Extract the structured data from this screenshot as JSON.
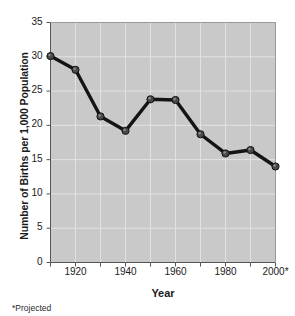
{
  "chart_data": {
    "type": "line",
    "title": "",
    "xlabel": "Year",
    "ylabel": "Number of Births per 1,000 Population",
    "footnote": "*Projected",
    "x": [
      1910,
      1920,
      1930,
      1940,
      1950,
      1960,
      1970,
      1980,
      1990,
      2000
    ],
    "values": [
      30.1,
      28.1,
      21.3,
      19.2,
      23.8,
      23.7,
      18.7,
      15.9,
      16.4,
      14.0
    ],
    "xlim": [
      1910,
      2000
    ],
    "ylim": [
      0,
      35
    ],
    "ytick_labels": [
      "0",
      "5",
      "10",
      "15",
      "20",
      "25",
      "30",
      "35"
    ],
    "ytick_values": [
      0,
      5,
      10,
      15,
      20,
      25,
      30,
      35
    ],
    "xtick_values": [
      1910,
      1920,
      1930,
      1940,
      1950,
      1960,
      1970,
      1980,
      1990,
      2000
    ],
    "xtick_labels": [
      "",
      "1920",
      "",
      "1940",
      "",
      "1960",
      "",
      "1980",
      "",
      "2000*"
    ],
    "grid": true,
    "legend": "none",
    "plot_bgcolor": "#c9c9c9",
    "gridline_color": "#e2e2e2",
    "line_color": "#141414",
    "marker_color": "#4a4a4a",
    "axis_color": "#555555"
  }
}
